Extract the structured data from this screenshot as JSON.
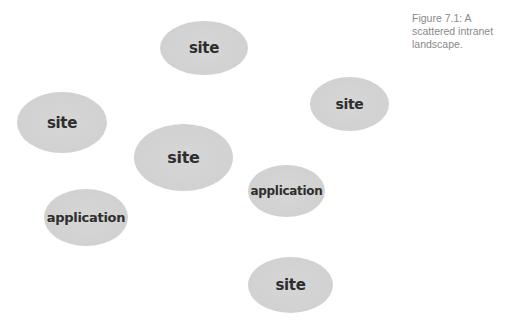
{
  "figure": {
    "caption": "Figure 7.1: A scattered intranet landscape."
  },
  "nodes": [
    {
      "label": "site",
      "type": "site"
    },
    {
      "label": "site",
      "type": "site"
    },
    {
      "label": "site",
      "type": "site"
    },
    {
      "label": "site",
      "type": "site"
    },
    {
      "label": "application",
      "type": "application"
    },
    {
      "label": "application",
      "type": "application"
    },
    {
      "label": "site",
      "type": "site"
    }
  ],
  "colors": {
    "node_fill": "#d2d2d2",
    "node_text": "#2e2e2e",
    "caption_text": "#8a8a8a",
    "background": "#ffffff"
  }
}
